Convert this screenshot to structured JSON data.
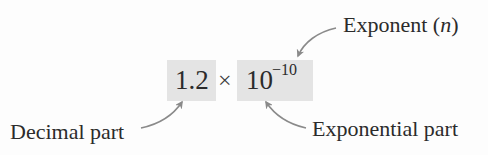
{
  "diagram": {
    "expression": {
      "decimal_part": "1.2",
      "times_symbol": "×",
      "base": "10",
      "exponent": "−10"
    },
    "labels": {
      "exponent": {
        "text": "Exponent",
        "open_paren": " (",
        "variable": "n",
        "close_paren": ")"
      },
      "decimal": "Decimal part",
      "exponential": "Exponential part"
    },
    "colors": {
      "highlight_box": "#e4e4e4",
      "arrow": "#8a8a8a",
      "text": "#2b2b2b"
    }
  }
}
